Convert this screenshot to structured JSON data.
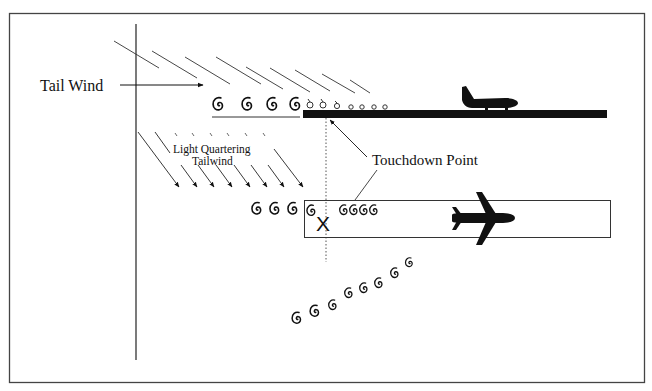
{
  "diagram": {
    "type": "wake-turbulence-tailwind-illustration",
    "labels": {
      "tail_wind": "Tail Wind",
      "light_quartering_line1": "Light Quartering",
      "light_quartering_line2": "Tailwind",
      "touchdown_point": "Touchdown Point",
      "touchdown_marker": "X"
    },
    "vortex_glyph": "G",
    "upper_scene": {
      "large_vortices_count": 4,
      "small_vortices_on_runway_count": 7,
      "aircraft": "small-propeller-aircraft-side-view"
    },
    "lower_scene": {
      "vortices_before_runway_count": 3,
      "vortices_on_runway_count": 5,
      "drifting_vortices_count": 8,
      "aircraft": "jet-aircraft-top-view"
    },
    "colors": {
      "ink": "#111111",
      "frame": "#444444",
      "background": "#ffffff"
    }
  }
}
